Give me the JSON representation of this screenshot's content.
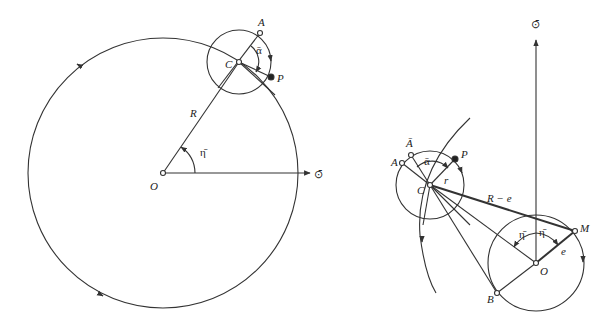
{
  "left_diagram": {
    "labels": {
      "A": "A",
      "C": "C",
      "P": "P",
      "R": "R",
      "O": "O",
      "alpha": "ᾱ",
      "eta": "η̄",
      "axis": "⊙̄"
    }
  },
  "right_diagram": {
    "labels": {
      "A_bar": "Ā",
      "A": "A",
      "alpha": "ᾱ",
      "P": "P",
      "r": "r",
      "C": "C",
      "R_minus_e": "R − e",
      "eta1": "η̄",
      "eta2": "η̄",
      "M": "M",
      "e": "e",
      "O": "O",
      "B": "B",
      "axis": "⊙̄"
    }
  },
  "colors": {
    "stroke": "#333333",
    "background": "#ffffff"
  }
}
